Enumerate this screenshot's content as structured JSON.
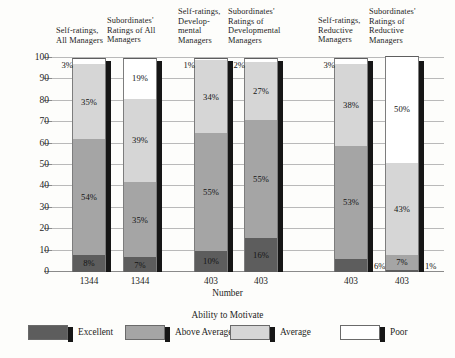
{
  "chart_data": {
    "type": "bar",
    "subtype": "stacked-100-percent",
    "title": "",
    "xlabel": "Number",
    "ylabel": "",
    "ylim": [
      0,
      100
    ],
    "yticks": [
      "0",
      "10",
      "20",
      "30",
      "40",
      "50",
      "60",
      "70",
      "80",
      "90",
      "100"
    ],
    "grid": true,
    "legend_title": "Ability to Motivate",
    "legend_position": "bottom",
    "legend": [
      "Excellent",
      "Above Average",
      "Average",
      "Poor"
    ],
    "colors": {
      "Excellent": "#5d5d5d",
      "Above Average": "#a5a5a5",
      "Average": "#d6d6d6",
      "Poor": "#ffffff"
    },
    "categories": [
      "Self-ratings, All Managers",
      "Subordinates' Ratings of All Managers",
      "Self-ratings, Developmental Managers",
      "Subordinates' Ratings of Developmental Managers",
      "Self-ratings, Reductive Managers",
      "Subordinates' Ratings of Reductive Managers"
    ],
    "category_header_lines": [
      [
        "Self-ratings,",
        "All Managers"
      ],
      [
        "Subordinates'",
        "Ratings of All",
        "Managers"
      ],
      [
        "Self-ratings,",
        "Develop-",
        "mental",
        "Managers"
      ],
      [
        "Subordinates'",
        "Ratings of",
        "Developmental",
        "Managers"
      ],
      [
        "Self-ratings,",
        "Reductive",
        "Managers"
      ],
      [
        "Subordinates'",
        "Ratings of",
        "Reductive",
        "Managers"
      ]
    ],
    "number_labels": [
      "1344",
      "1344",
      "403",
      "403",
      "403",
      "403"
    ],
    "series": [
      {
        "name": "Excellent",
        "values": [
          8,
          7,
          10,
          16,
          6,
          1
        ]
      },
      {
        "name": "Above Average",
        "values": [
          54,
          35,
          55,
          55,
          53,
          7
        ]
      },
      {
        "name": "Average",
        "values": [
          35,
          39,
          34,
          27,
          38,
          43
        ]
      },
      {
        "name": "Poor",
        "values": [
          3,
          19,
          1,
          2,
          3,
          50
        ]
      }
    ],
    "data_labels": [
      {
        "Excellent": "8%",
        "Above Average": "54%",
        "Average": "35%",
        "Poor": "3%"
      },
      {
        "Excellent": "7%",
        "Above Average": "35%",
        "Average": "39%",
        "Poor": "19%"
      },
      {
        "Excellent": "10%",
        "Above Average": "55%",
        "Average": "34%",
        "Poor": "1%"
      },
      {
        "Excellent": "16%",
        "Above Average": "55%",
        "Average": "27%",
        "Poor": "2%"
      },
      {
        "Excellent": "6%",
        "Above Average": "53%",
        "Average": "38%",
        "Poor": "3%"
      },
      {
        "Excellent": "1%",
        "Above Average": "7%",
        "Average": "43%",
        "Poor": "50%"
      }
    ]
  }
}
